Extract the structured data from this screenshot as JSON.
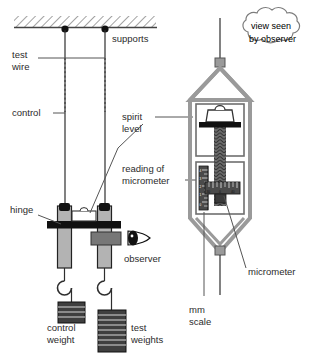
{
  "labels": {
    "supports": "supports",
    "test_wire": "test\nwire",
    "test_wire_l1": "test",
    "test_wire_l2": "wire",
    "control": "control",
    "spirit_level_l1": "spirit",
    "spirit_level_l2": "level",
    "reading_l1": "reading of",
    "reading_l2": "micrometer",
    "hinge": "hinge",
    "observer": "observer",
    "control_weight_l1": "control",
    "control_weight_l2": "weight",
    "test_weights_l1": "test",
    "test_weights_l2": "weights",
    "mm_scale_l1": "mm",
    "mm_scale_l2": "scale",
    "micrometer": "micrometer",
    "callout_l1": "view seen",
    "callout_l2": "by observer"
  },
  "micrometer_scale": {
    "thimble_numbers": [
      "30",
      "0",
      "40"
    ],
    "vertical_numbers": [
      "4",
      "3",
      "2",
      "1",
      "0"
    ]
  },
  "colors": {
    "ink": "#2b2b2b",
    "wire": "#2e2e2e",
    "leader": "#555555",
    "frame_gray": "#9a9a9a",
    "bar_gray": "#b3b3b3",
    "dark_block": "#4a4a4a",
    "black": "#111111",
    "panel_fill": "#ffffff",
    "hatch": "#8c8c8c"
  },
  "counts": {
    "control_weight_slabs": 4,
    "test_weight_slabs": 8
  }
}
